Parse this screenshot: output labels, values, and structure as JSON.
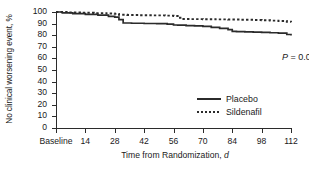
{
  "chart_data": {
    "type": "line",
    "title": "",
    "xlabel": "Time from Randomization, d",
    "ylabel": "No clinical worsening event, %",
    "xlim": [
      0,
      112
    ],
    "ylim": [
      0,
      100
    ],
    "grid": false,
    "legend_position": "center-right",
    "x_tick_values": [
      0,
      14,
      28,
      42,
      56,
      70,
      84,
      98,
      112
    ],
    "x_tick_labels": [
      "Baseline",
      "14",
      "28",
      "42",
      "56",
      "70",
      "84",
      "98",
      "112"
    ],
    "y_tick_values": [
      0,
      10,
      20,
      30,
      40,
      50,
      60,
      70,
      80,
      90,
      100
    ],
    "y_tick_labels": [
      "0",
      "10",
      "20",
      "30",
      "40",
      "50",
      "60",
      "70",
      "80",
      "90",
      "100"
    ],
    "annotations": [
      {
        "text": "P = 0.002",
        "italic_prefix": "P",
        "rest": " = 0.002"
      }
    ],
    "series": [
      {
        "name": "Placebo",
        "style": "solid",
        "color": "#2b2b2b",
        "step": "post",
        "x": [
          0,
          3,
          8,
          14,
          20,
          25,
          28,
          30,
          32,
          36,
          42,
          48,
          53,
          56,
          58,
          62,
          66,
          70,
          74,
          78,
          82,
          84,
          86,
          90,
          94,
          98,
          102,
          106,
          110,
          112
        ],
        "y": [
          100,
          99.3,
          98.6,
          98.0,
          97.3,
          96.3,
          95.6,
          93.5,
          90.5,
          90.3,
          90.1,
          89.9,
          89.6,
          88.8,
          88.6,
          88.3,
          88.0,
          87.6,
          86.8,
          85.8,
          84.8,
          83.3,
          83.1,
          82.9,
          82.7,
          82.4,
          82.1,
          81.8,
          80.6,
          79.8
        ]
      },
      {
        "name": "Sildenafil",
        "style": "dotted",
        "color": "#2b2b2b",
        "step": "post",
        "x": [
          0,
          6,
          12,
          18,
          24,
          28,
          30,
          34,
          40,
          46,
          52,
          56,
          58,
          60,
          64,
          70,
          76,
          82,
          88,
          94,
          98,
          102,
          106,
          110,
          112
        ],
        "y": [
          100,
          99.6,
          99.3,
          99.0,
          98.7,
          98.4,
          97.6,
          97.4,
          97.2,
          97.1,
          96.9,
          96.6,
          95.0,
          94.0,
          93.9,
          93.8,
          93.6,
          93.5,
          93.3,
          93.1,
          92.9,
          92.6,
          92.3,
          91.6,
          91.2
        ]
      }
    ]
  },
  "legend": {
    "items": [
      {
        "label": "Placebo",
        "style": "solid"
      },
      {
        "label": "Sildenafil",
        "style": "dotted"
      }
    ]
  }
}
